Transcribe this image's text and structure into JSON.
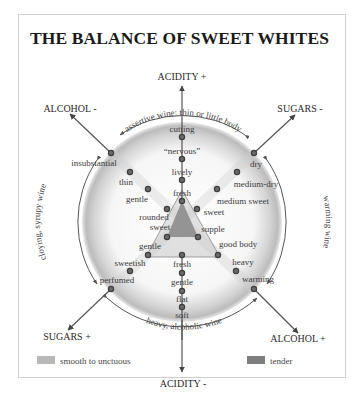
{
  "title": "THE BALANCE OF SWEET WHITES",
  "colors": {
    "axis": "#555555",
    "arrowhead": "#444444",
    "dot_fill": "#6a6a6a",
    "dot_ring": "#444444",
    "circle_shade": "#bdbdbd",
    "smooth_swatch": "#b8b8b8",
    "tender_swatch": "#7e7e7e",
    "triangle_outer": "#c9c9c9",
    "triangle_inner": "#8c8c8c"
  },
  "axes": {
    "acidity_plus": "ACIDITY +",
    "acidity_minus": "ACIDITY -",
    "alcohol_minus": "ALCOHOL -",
    "alcohol_plus": "ALCOHOL +",
    "sugars_minus": "SUGARS -",
    "sugars_plus": "SUGARS +"
  },
  "arcs": {
    "top": "assertive wine: thin or little body",
    "left": "cloying, syrupy wine",
    "right": "warming wine",
    "bottom": "heavy, alcoholic wine"
  },
  "points": {
    "acidity_upper": [
      "cutting",
      "“nervous”",
      "lively",
      "fresh"
    ],
    "acidity_lower": [
      "fresh",
      "gentle",
      "flat",
      "soft"
    ],
    "alcohol_upper": [
      "insubstantial",
      "thin",
      "gentle",
      "rounded",
      "sweet"
    ],
    "alcohol_lower": [
      "supple",
      "good body",
      "heavy",
      "warming"
    ],
    "sugars_upper": [
      "dry",
      "medium-dry",
      "medium sweet",
      "sweet"
    ],
    "sugars_lower": [
      "gentle",
      "sweetish",
      "perfumed"
    ]
  },
  "legend": [
    {
      "label": "smooth to unctuous",
      "color": "#b8b8b8"
    },
    {
      "label": "tender",
      "color": "#7e7e7e"
    }
  ]
}
